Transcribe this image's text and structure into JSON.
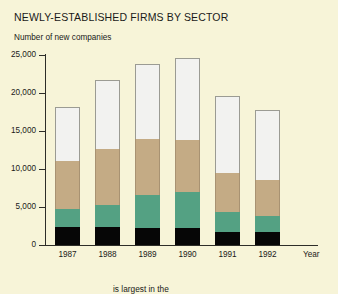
{
  "chart_data": {
    "type": "bar",
    "subtype": "stacked-column",
    "title": "NEWLY-ESTABLISHED FIRMS BY SECTOR",
    "ylabel": "Number of new companies",
    "xlabel": "Year",
    "categories": [
      "1987",
      "1988",
      "1989",
      "1990",
      "1991",
      "1992"
    ],
    "ylim": [
      0,
      25000
    ],
    "ytick_labels": [
      "25,000",
      "20,000",
      "15,000",
      "10,000",
      "5,000",
      "0"
    ],
    "ytick_values": [
      25000,
      20000,
      15000,
      10000,
      5000,
      0
    ],
    "grid": false,
    "legend": "none",
    "series": [
      {
        "name": "sector-1",
        "color": "#060606",
        "values": [
          2370,
          2370,
          2240,
          2240,
          1710,
          1710
        ]
      },
      {
        "name": "sector-2",
        "color": "#54a183",
        "values": [
          2370,
          2890,
          4340,
          4740,
          2630,
          2110
        ]
      },
      {
        "name": "sector-3",
        "color": "#c4ab85",
        "values": [
          6320,
          7370,
          7370,
          6840,
          5130,
          4740
        ]
      },
      {
        "name": "sector-4",
        "color": "#f2f2f0",
        "values": [
          7100,
          9080,
          9870,
          10790,
          10130,
          9210
        ]
      }
    ],
    "totals": [
      18160,
      21710,
      23820,
      24610,
      19600,
      17770
    ]
  },
  "caption": {
    "text": "is largest in the"
  }
}
